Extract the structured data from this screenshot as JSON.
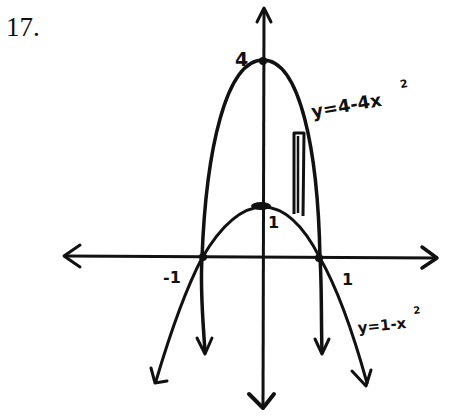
{
  "problem": {
    "number": "17."
  },
  "axes": {
    "x_tick_neg": "-1",
    "x_tick_pos": "1",
    "y_tick_top": "4",
    "y_tick_inner": "1"
  },
  "curves": [
    {
      "name": "outer-parabola",
      "equation": "y=4-4x",
      "exponent": "2",
      "vertex": [
        0,
        4
      ],
      "roots": [
        -1,
        1
      ]
    },
    {
      "name": "inner-parabola",
      "equation": "y=1-x",
      "exponent": "2",
      "vertex": [
        0,
        1
      ],
      "roots": [
        -1,
        1
      ]
    }
  ],
  "strip": {
    "description": "representative vertical rectangle between curves"
  },
  "colors": {
    "ink": "#111111",
    "paper": "#ffffff"
  }
}
